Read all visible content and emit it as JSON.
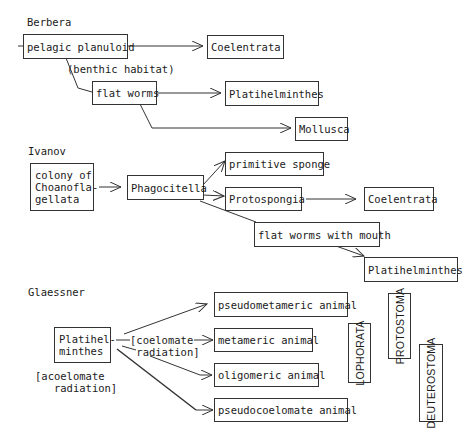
{
  "sections": {
    "berbera": {
      "title": "Berbera",
      "nodes": {
        "pelagic_planuloid": "pelagic planuloid",
        "coelentrata": "Coelentrata",
        "flat_worms": "flat worms",
        "platihelminthes": "Platihelminthes",
        "mollusca": "Mollusca"
      },
      "annotations": {
        "benthic_habitat": "(benthic habitat)"
      }
    },
    "ivanov": {
      "title": "Ivanov",
      "nodes": {
        "colony": "colony of\nChoanofla-\ngellata",
        "phagocitella": "Phagocitella",
        "primitive_sponge": "primitive sponge",
        "protospongia": "Protospongia",
        "coelentrata": "Coelentrata",
        "flat_worms_with_mouth": "flat worms with mouth",
        "platihelminthes": "Platihelminthes"
      }
    },
    "glaessner": {
      "title": "Glaessner",
      "nodes": {
        "platihelminthes": "Platihel-\nminthes",
        "pseudometameric": "pseudometameric animal",
        "metameric": "metameric animal",
        "oligomeric": "oligomeric animal",
        "pseudocoelomate": "pseudocoelomate animal"
      },
      "annotations": {
        "coelomate_radiation": "[coelomate\n radiation]",
        "acoelomate_radiation": "[acoelomate\n   radiation]"
      },
      "groups": {
        "lophorata": "LOPHORATA",
        "protostoma": "PROTOSTOMA",
        "deuterostoma": "DEUTEROSTOMA"
      }
    }
  },
  "colors": {
    "line": "#333333",
    "text": "#1a1a1a",
    "background": "#ffffff"
  }
}
